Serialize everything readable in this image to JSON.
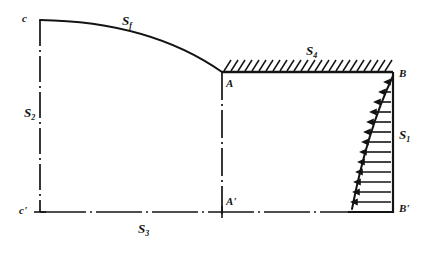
{
  "figure": {
    "kind": "engineering-diagram",
    "ink_color": "#141414",
    "background_color": "#ffffff",
    "labels": {
      "corner_top_left": "c",
      "corner_bottom_left": "c'",
      "junction_top": "A",
      "junction_bottom": "A'",
      "corner_top_right": "B",
      "corner_bottom_right": "B'"
    },
    "surfaces": {
      "free_surface": {
        "symbol": "S",
        "subscript": "f"
      },
      "left_boundary": {
        "symbol": "S",
        "subscript": "2"
      },
      "bottom_boundary": {
        "symbol": "S",
        "subscript": "3"
      },
      "hatched_boundary": {
        "symbol": "S",
        "subscript": "4"
      },
      "loaded_boundary": {
        "symbol": "S",
        "subscript": "1"
      }
    },
    "geometry": {
      "c": [
        40,
        20
      ],
      "c_prime": [
        40,
        212
      ],
      "A": [
        222,
        72
      ],
      "A_prime": [
        222,
        212
      ],
      "B": [
        393,
        72
      ],
      "B_prime": [
        393,
        212
      ],
      "free_surface_curve": "M40,20 C 110,21 175,38 222,72",
      "pressure_curve": "M393,76 C 372,120 358,172 351,208"
    },
    "pressure_arrows": {
      "count": 14,
      "direction": "left",
      "note": "arrow lengths increase from B down to B'"
    },
    "hatching": {
      "side": "above",
      "tick_count": 26,
      "slant": "up-right"
    }
  }
}
